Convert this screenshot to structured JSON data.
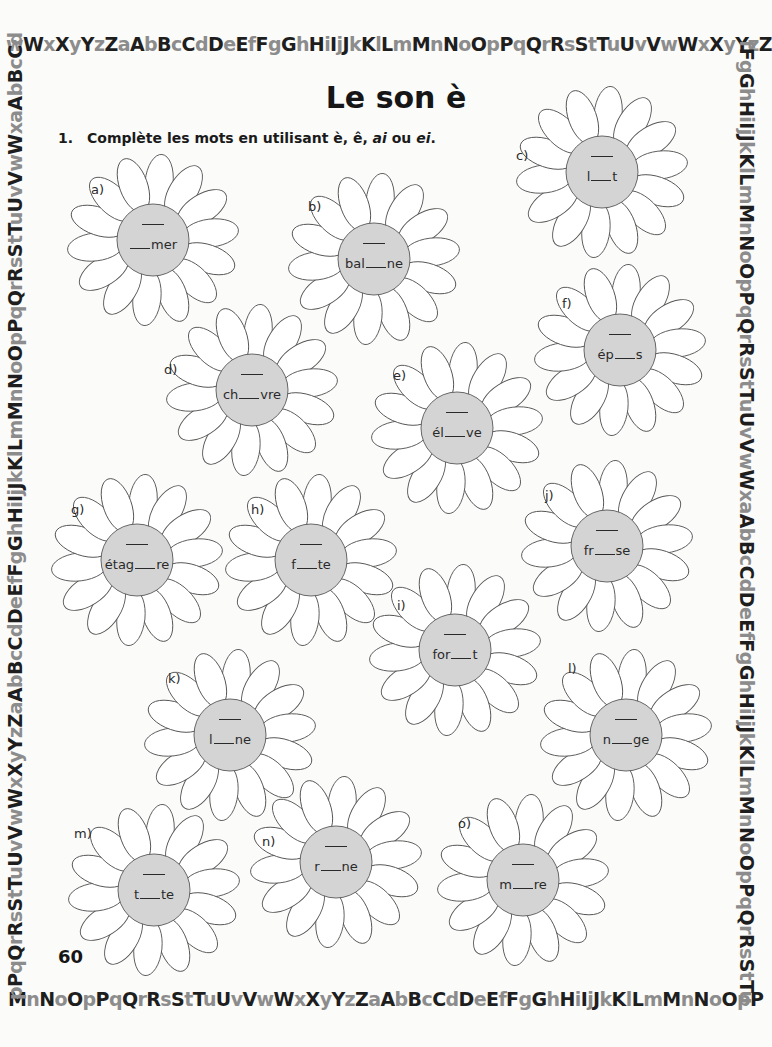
{
  "border": {
    "top": "wWxXyYzZaAbBcCdDeEfFgGhHiIjJkKlLmMnNoOpPqQrRsStTuUvVwWxXyYzZ",
    "bottom": "MnNoOpPqQrRsStTuUvVwWxXyYzZaAbBcCdDeEfFgGhHiIjJkKlLmMnNoOpP",
    "left": "pPqQrRsStTuUvVwWxXyYzZaAbBcCdDeEfFgGhHiIjJkKlLmMnNoOpPqQrRsStTuUvVwWxaAbBcCd",
    "right": "fFgGhHiIjJkKlLmMnNoOpPqQrRsStTuUvVwWxaAbBcCdDeEfFgGhHiIjJkKlLmMnNoOpPqQrRsStTu"
  },
  "title": "Le son è",
  "instruction": {
    "number": "1.",
    "text_before": "Complète les mots en utilisant è, ê, ",
    "ai": "ai",
    "text_mid": " ou ",
    "ei": "ei",
    "text_end": "."
  },
  "flowers": [
    {
      "label": "a)",
      "before": "",
      "after": "mer",
      "x": 153,
      "y": 240,
      "lx": -62,
      "ly": -58
    },
    {
      "label": "b)",
      "before": "bal",
      "after": "ne",
      "x": 374,
      "y": 259,
      "lx": -66,
      "ly": -60
    },
    {
      "label": "c)",
      "before": "l",
      "after": "t",
      "x": 602,
      "y": 172,
      "lx": -86,
      "ly": -24
    },
    {
      "label": "d)",
      "before": "ch",
      "after": "vre",
      "x": 252,
      "y": 390,
      "lx": -88,
      "ly": -28
    },
    {
      "label": "e)",
      "before": "él",
      "after": "ve",
      "x": 457,
      "y": 428,
      "lx": -64,
      "ly": -60
    },
    {
      "label": "f)",
      "before": "ép",
      "after": "s",
      "x": 620,
      "y": 350,
      "lx": -58,
      "ly": -54
    },
    {
      "label": "g)",
      "before": "étag",
      "after": "re",
      "x": 137,
      "y": 560,
      "lx": -66,
      "ly": -58
    },
    {
      "label": "h)",
      "before": "f",
      "after": "te",
      "x": 311,
      "y": 560,
      "lx": -60,
      "ly": -58
    },
    {
      "label": "i)",
      "before": "for",
      "after": "t",
      "x": 455,
      "y": 650,
      "lx": -58,
      "ly": -52
    },
    {
      "label": "j)",
      "before": "fr",
      "after": "se",
      "x": 607,
      "y": 546,
      "lx": -62,
      "ly": -58
    },
    {
      "label": "k)",
      "before": "l",
      "after": "ne",
      "x": 230,
      "y": 735,
      "lx": -62,
      "ly": -64
    },
    {
      "label": "l)",
      "before": "n",
      "after": "ge",
      "x": 626,
      "y": 735,
      "lx": -58,
      "ly": -74
    },
    {
      "label": "m)",
      "before": "t",
      "after": "te",
      "x": 154,
      "y": 890,
      "lx": -80,
      "ly": -64
    },
    {
      "label": "n)",
      "before": "r",
      "after": "ne",
      "x": 336,
      "y": 862,
      "lx": -74,
      "ly": -28
    },
    {
      "label": "o)",
      "before": "m",
      "after": "re",
      "x": 523,
      "y": 880,
      "lx": -65,
      "ly": -64
    }
  ],
  "page_number": "60"
}
